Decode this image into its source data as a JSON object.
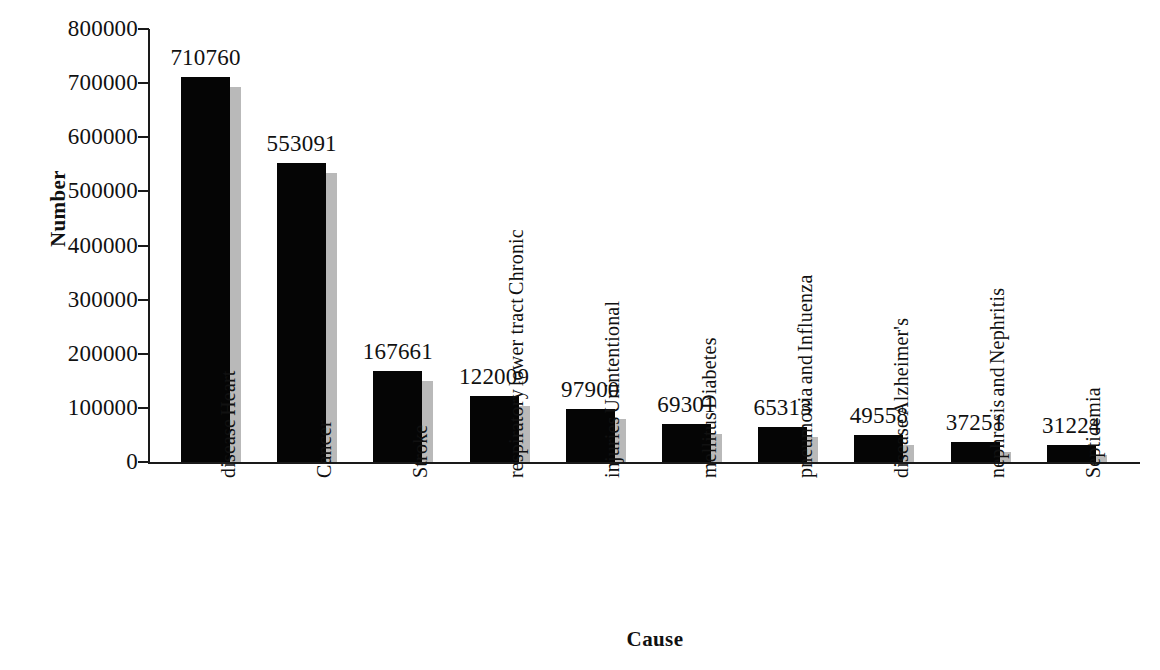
{
  "chart_data": {
    "type": "bar",
    "title": "",
    "xlabel": "Cause",
    "ylabel": "Number",
    "ylim": [
      0,
      800000
    ],
    "ytick_labels": [
      "800000",
      "700000",
      "600000",
      "500000",
      "400000",
      "300000",
      "200000",
      "100000",
      "0"
    ],
    "yticks": [
      800000,
      700000,
      600000,
      500000,
      400000,
      300000,
      200000,
      100000,
      0
    ],
    "grid": false,
    "legend": "none",
    "categories": [
      "Heart disease",
      "Cancer",
      "Stroke",
      "Chronic lower tract respiratory",
      "Unintentional injuries",
      "Diabetes mellitus",
      "Influenza and pneumonia",
      "Alzheimer's disease",
      "Nephritis and nephrosis",
      "Septicemia"
    ],
    "category_lines": [
      [
        "Heart",
        "disease"
      ],
      [
        "Cancer"
      ],
      [
        "Stroke"
      ],
      [
        "Chronic",
        "lower tract",
        "respiratory"
      ],
      [
        "Unintentional",
        "injuries"
      ],
      [
        "Diabetes",
        "mellitus"
      ],
      [
        "Influenza",
        "and",
        "pneumonia"
      ],
      [
        "Alzheimer's",
        "disease"
      ],
      [
        "Nephritis",
        "and",
        "nephrosis"
      ],
      [
        "Septicemia"
      ]
    ],
    "values": [
      710760,
      553091,
      167661,
      122009,
      97900,
      69301,
      65313,
      49558,
      37251,
      31224
    ],
    "value_labels": [
      "710760",
      "553091",
      "167661",
      "122009",
      "97900",
      "69301",
      "65313",
      "49558",
      "37251",
      "31224"
    ],
    "bar_color": "#050505",
    "shadow_color": "#b9b9b9",
    "axis_color": "#1a1a1a"
  }
}
